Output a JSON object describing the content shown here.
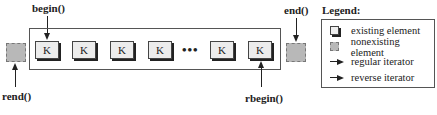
{
  "diagram": {
    "element_label": "K",
    "ellipsis": "•••",
    "iterators": {
      "begin": "begin()",
      "end": "end()",
      "rbegin": "rbegin()",
      "rend": "rend()"
    }
  },
  "legend": {
    "title": "Legend:",
    "items": [
      {
        "icon": "existing-element-icon",
        "label": "existing element"
      },
      {
        "icon": "nonexisting-element-icon",
        "label": "nonexisting element"
      },
      {
        "icon": "regular-iterator-arrow-icon",
        "label": "regular iterator"
      },
      {
        "icon": "reverse-iterator-arrow-icon",
        "label": "reverse iterator"
      }
    ]
  },
  "colors": {
    "element_fill": "#ececec",
    "ghost_fill": "#b8b8b8",
    "stroke": "#222222"
  }
}
